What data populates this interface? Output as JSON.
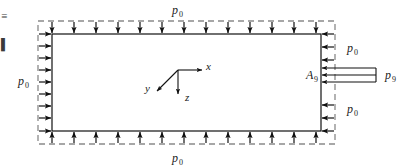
{
  "figure": {
    "name": "pressure-loading-diagram",
    "background_color": "#ffffff",
    "line_color": "#1a1a1a",
    "dashed_color": "#808080",
    "width": 411,
    "height": 165,
    "labels": {
      "p0_top": {
        "symbol": "p",
        "subscript": "0"
      },
      "p0_bottom": {
        "symbol": "p",
        "subscript": "0"
      },
      "p0_left": {
        "symbol": "p",
        "subscript": "0"
      },
      "p0_right_upper": {
        "symbol": "p",
        "subscript": "0"
      },
      "p0_right_lower": {
        "symbol": "p",
        "subscript": "0"
      },
      "p9_right": {
        "symbol": "p",
        "subscript": "9"
      },
      "a9_right": {
        "symbol": "A",
        "subscript": "9"
      }
    },
    "axes": {
      "x_label": "x",
      "y_label": "y",
      "z_label": "z"
    },
    "margin_fragments": {
      "top": "≡",
      "bottom": "▌"
    },
    "arrow_counts": {
      "top_down": 13,
      "bottom_up": 13,
      "left_right": 9,
      "right_left_upper": 2,
      "right_left_lower": 2,
      "nozzle_left": 3
    }
  }
}
